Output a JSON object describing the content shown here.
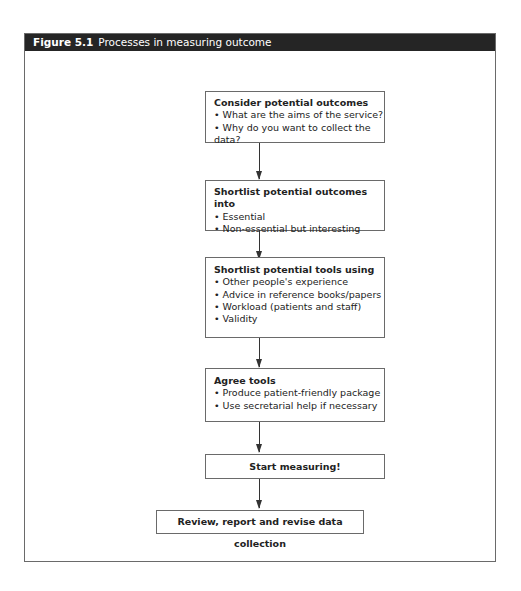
{
  "figure": {
    "number": "Figure 5.1",
    "title": "Processes in measuring outcome"
  },
  "flowchart": {
    "steps": [
      {
        "heading": "Consider potential outcomes",
        "bullets": [
          "What are the aims of the service?",
          "Why do you want to collect the data?"
        ]
      },
      {
        "heading": "Shortlist potential outcomes into",
        "bullets": [
          "Essential",
          "Non-essential but interesting"
        ]
      },
      {
        "heading": "Shortlist potential tools using",
        "bullets": [
          "Other people's experience",
          "Advice in reference books/papers",
          "Workload (patients and staff)",
          "Validity"
        ]
      },
      {
        "heading": "Agree tools",
        "bullets": [
          "Produce patient-friendly package",
          "Use secretarial help if necessary"
        ]
      },
      {
        "heading": "Start measuring!",
        "bullets": []
      },
      {
        "heading": "Review, report and revise data collection",
        "bullets": []
      }
    ]
  }
}
